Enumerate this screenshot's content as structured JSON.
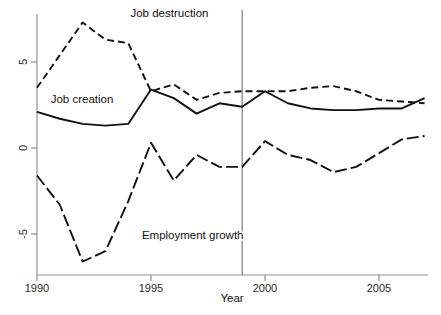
{
  "chart_data": {
    "type": "line",
    "title": "",
    "subtitle": "",
    "xlabel": "Year",
    "ylabel": "",
    "xlim": [
      1990,
      2007
    ],
    "ylim": [
      -7.5,
      8.2
    ],
    "grid": false,
    "legend_position": "inline-annotations",
    "x_ticks": [
      "1990",
      "1995",
      "2000",
      "2005"
    ],
    "x_tick_values": [
      1990,
      1995,
      2000,
      2005
    ],
    "y_ticks": [
      "5",
      "0",
      "-5"
    ],
    "y_tick_values": [
      5,
      0,
      -5
    ],
    "x": [
      1990,
      1991,
      1992,
      1993,
      1994,
      1995,
      1996,
      1997,
      1998,
      1999,
      2000,
      2001,
      2002,
      2003,
      2004,
      2005,
      2006,
      2007
    ],
    "series": [
      {
        "name": "Job creation",
        "style": "solid",
        "color": "#111111",
        "values": [
          2.1,
          1.7,
          1.4,
          1.3,
          1.4,
          3.4,
          2.9,
          2.0,
          2.6,
          2.4,
          3.3,
          2.6,
          2.3,
          2.2,
          2.2,
          2.3,
          2.3,
          2.9
        ]
      },
      {
        "name": "Job destruction",
        "style": "dashed",
        "color": "#111111",
        "values": [
          3.5,
          5.4,
          7.3,
          6.3,
          6.1,
          3.3,
          3.7,
          2.8,
          3.2,
          3.3,
          3.3,
          3.3,
          3.5,
          3.6,
          3.3,
          2.8,
          2.7,
          2.6
        ]
      },
      {
        "name": "Employment growth",
        "style": "dash-dot",
        "color": "#111111",
        "values": [
          -1.6,
          -3.3,
          -6.6,
          -6.0,
          -3.1,
          0.3,
          -1.9,
          -0.4,
          -1.1,
          -1.1,
          0.4,
          -0.4,
          -0.7,
          -1.4,
          -1.1,
          -0.3,
          0.5,
          0.7
        ]
      }
    ],
    "annotations": [
      {
        "name": "Job destruction",
        "text": "Job destruction",
        "x": 1994.1,
        "y": 7.6
      },
      {
        "name": "Job creation",
        "text": "Job creation",
        "x": 1990.6,
        "y": 2.6
      },
      {
        "name": "Employment growth",
        "text": "Employment growth",
        "x": 1994.6,
        "y": -5.3
      }
    ],
    "reference_lines": [
      {
        "name": "vertical-rule-1999",
        "orientation": "vertical",
        "value": 1999,
        "color": "#909090"
      }
    ],
    "axis_color": "#909090",
    "axis_title_x": "Year"
  }
}
